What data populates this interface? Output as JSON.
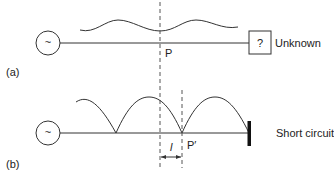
{
  "diagram": {
    "panel_a": {
      "label": "(a)",
      "source_symbol": "~",
      "point_label": "P",
      "load_symbol": "?",
      "load_label": "Unknown"
    },
    "panel_b": {
      "label": "(b)",
      "source_symbol": "~",
      "point_label": "P′",
      "distance_label": "l",
      "load_label": "Short circuit"
    },
    "colors": {
      "stroke": "#333333",
      "dashed": "#555555",
      "text": "#222222"
    }
  }
}
